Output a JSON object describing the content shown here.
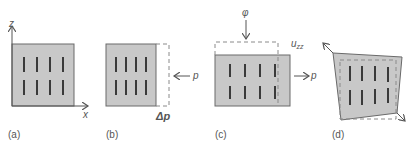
{
  "colors": {
    "fill": "#c8c8c8",
    "stroke": "#6a6a6a",
    "dash": "#8a8a8a",
    "bar": "#3a3a3a",
    "text": "#555555"
  },
  "panels": [
    {
      "id": "a",
      "caption": "(a)",
      "axis_z": "z",
      "axis_x": "x"
    },
    {
      "id": "b",
      "caption": "(b)",
      "force": "p",
      "delta": "Δp"
    },
    {
      "id": "c",
      "caption": "(c)",
      "force_top": "φ",
      "strain": "u",
      "strain_sub": "zz",
      "force": "p"
    },
    {
      "id": "d",
      "caption": "(d)"
    }
  ]
}
